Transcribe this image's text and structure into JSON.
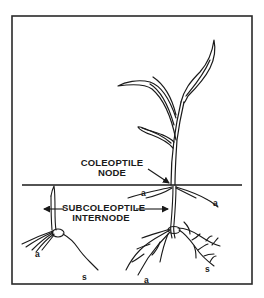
{
  "diagram": {
    "type": "botanical-illustration",
    "colors": {
      "line": "#1a1a1a",
      "background": "#ffffff",
      "frame": "#2a2a2a"
    },
    "labels": {
      "coleoptile_node_line1": "COLEOPTILE",
      "coleoptile_node_line2": "NODE",
      "subcoleoptile_line1": "SUBCOLEOPTILE",
      "subcoleoptile_line2": "INTERNODE",
      "adventitious_root_left_small": "a",
      "seminal_root_small": "s",
      "adventitious_root_upper_left": "a",
      "adventitious_root_upper_right": "a",
      "adventitious_root_lower": "a",
      "seminal_root_large": "s"
    }
  }
}
